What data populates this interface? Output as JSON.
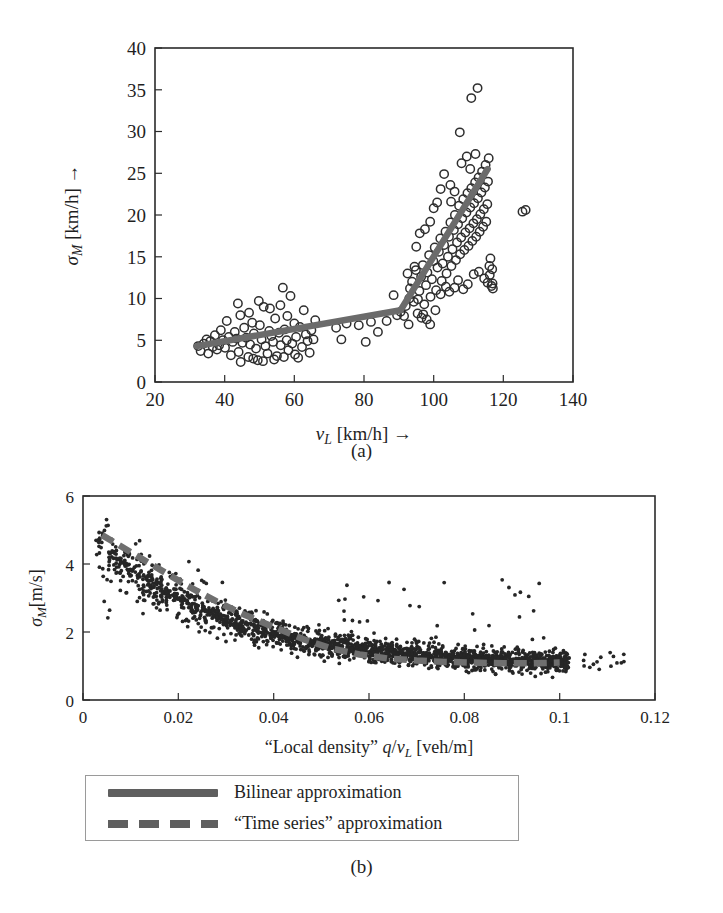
{
  "figure": {
    "panel_a_caption": "(a)",
    "panel_b_caption": "(b)"
  },
  "legend": {
    "position": "below-panel-b",
    "items": [
      {
        "label": "Bilinear approximation",
        "style": "solid",
        "color": "#5f5f5f"
      },
      {
        "label": "“Time series” approximation",
        "style": "dashed",
        "color": "#5f5f5f"
      }
    ]
  },
  "chart_data": [
    {
      "type": "scatter",
      "id": "panel-a",
      "title": "",
      "xlabel": "v_L [km/h] →",
      "xlabel_parts": {
        "symbol": "v",
        "subscript": "L",
        "unit": "[km/h]",
        "arrow": "→"
      },
      "ylabel": "σ_M [km/h] →",
      "ylabel_parts": {
        "symbol": "σ",
        "subscript": "M",
        "unit": "[km/h]",
        "arrow": "→"
      },
      "xlim": [
        20,
        140
      ],
      "ylim": [
        0,
        40
      ],
      "xticks": [
        20,
        40,
        60,
        80,
        100,
        120,
        140
      ],
      "xticklabels": [
        "20",
        "40",
        "60",
        "80",
        "100",
        "120",
        "140"
      ],
      "yticks": [
        0,
        5,
        10,
        15,
        20,
        25,
        30,
        35,
        40
      ],
      "yticklabels": [
        "0",
        "5",
        "10",
        "15",
        "20",
        "25",
        "30",
        "35",
        "40"
      ],
      "grid": false,
      "marker": "open-circle",
      "marker_color": "#2e2e2e",
      "series": [
        {
          "name": "Measured data",
          "type": "scatter",
          "points": [
            [
              32.4,
              4.3
            ],
            [
              33.1,
              3.7
            ],
            [
              34.0,
              4.6
            ],
            [
              34.8,
              5.1
            ],
            [
              35.3,
              3.4
            ],
            [
              35.9,
              4.9
            ],
            [
              36.6,
              4.2
            ],
            [
              37.2,
              5.6
            ],
            [
              37.8,
              3.9
            ],
            [
              38.4,
              4.4
            ],
            [
              38.9,
              6.2
            ],
            [
              39.5,
              5.0
            ],
            [
              40.1,
              4.1
            ],
            [
              40.6,
              7.3
            ],
            [
              41.2,
              5.4
            ],
            [
              41.8,
              3.2
            ],
            [
              42.3,
              4.8
            ],
            [
              42.9,
              6.0
            ],
            [
              43.4,
              5.2
            ],
            [
              44.0,
              3.6
            ],
            [
              44.5,
              8.0
            ],
            [
              45.1,
              4.7
            ],
            [
              45.6,
              6.5
            ],
            [
              46.2,
              5.3
            ],
            [
              46.8,
              3.0
            ],
            [
              47.3,
              4.5
            ],
            [
              47.9,
              7.1
            ],
            [
              48.4,
              5.8
            ],
            [
              49.0,
              4.0
            ],
            [
              49.5,
              2.6
            ],
            [
              50.1,
              6.8
            ],
            [
              50.6,
              5.1
            ],
            [
              51.2,
              9.0
            ],
            [
              51.7,
              4.3
            ],
            [
              52.3,
              3.4
            ],
            [
              52.8,
              6.1
            ],
            [
              53.4,
              5.5
            ],
            [
              53.9,
              4.8
            ],
            [
              54.5,
              7.6
            ],
            [
              55.0,
              3.1
            ],
            [
              55.6,
              5.9
            ],
            [
              56.1,
              4.4
            ],
            [
              56.7,
              11.3
            ],
            [
              57.2,
              6.3
            ],
            [
              57.8,
              5.0
            ],
            [
              58.3,
              3.8
            ],
            [
              58.9,
              10.3
            ],
            [
              59.4,
              4.6
            ],
            [
              60.0,
              7.0
            ],
            [
              60.5,
              5.4
            ],
            [
              61.1,
              2.9
            ],
            [
              61.6,
              6.6
            ],
            [
              62.2,
              4.2
            ],
            [
              62.7,
              8.6
            ],
            [
              63.3,
              5.7
            ],
            [
              63.8,
              4.9
            ],
            [
              64.4,
              3.5
            ],
            [
              64.9,
              6.2
            ],
            [
              65.5,
              5.1
            ],
            [
              66.0,
              7.4
            ],
            [
              43.8,
              9.4
            ],
            [
              47.0,
              8.3
            ],
            [
              49.8,
              9.7
            ],
            [
              53.0,
              8.8
            ],
            [
              56.0,
              9.2
            ],
            [
              58.0,
              7.9
            ],
            [
              44.6,
              2.4
            ],
            [
              48.2,
              2.8
            ],
            [
              51.0,
              2.5
            ],
            [
              54.2,
              2.7
            ],
            [
              57.0,
              3.0
            ],
            [
              60.2,
              3.3
            ],
            [
              72.0,
              6.5
            ],
            [
              73.5,
              5.1
            ],
            [
              75.0,
              7.0
            ],
            [
              78.5,
              6.8
            ],
            [
              80.5,
              4.8
            ],
            [
              82.0,
              7.2
            ],
            [
              84.0,
              6.0
            ],
            [
              86.5,
              7.3
            ],
            [
              88.5,
              10.4
            ],
            [
              89.5,
              8.0
            ],
            [
              90.5,
              8.4
            ],
            [
              91.5,
              7.9
            ],
            [
              92.0,
              9.1
            ],
            [
              92.8,
              6.9
            ],
            [
              93.2,
              11.2
            ],
            [
              93.8,
              12.0
            ],
            [
              94.3,
              9.6
            ],
            [
              94.9,
              13.4
            ],
            [
              95.4,
              8.2
            ],
            [
              95.9,
              10.9
            ],
            [
              96.4,
              12.6
            ],
            [
              96.9,
              14.0
            ],
            [
              97.3,
              9.3
            ],
            [
              97.8,
              11.6
            ],
            [
              98.2,
              13.1
            ],
            [
              98.7,
              15.2
            ],
            [
              99.1,
              10.2
            ],
            [
              99.5,
              12.3
            ],
            [
              99.9,
              14.5
            ],
            [
              100.3,
              16.1
            ],
            [
              100.7,
              11.0
            ],
            [
              101.1,
              13.7
            ],
            [
              101.5,
              15.6
            ],
            [
              101.9,
              17.2
            ],
            [
              102.3,
              12.1
            ],
            [
              102.6,
              14.2
            ],
            [
              103.0,
              16.4
            ],
            [
              103.4,
              18.0
            ],
            [
              103.7,
              13.0
            ],
            [
              104.1,
              15.0
            ],
            [
              104.4,
              17.4
            ],
            [
              104.8,
              19.1
            ],
            [
              105.1,
              13.9
            ],
            [
              105.4,
              15.9
            ],
            [
              105.8,
              18.2
            ],
            [
              106.1,
              20.0
            ],
            [
              106.4,
              14.6
            ],
            [
              106.7,
              16.7
            ],
            [
              107.0,
              18.9
            ],
            [
              107.3,
              21.1
            ],
            [
              107.6,
              15.3
            ],
            [
              107.9,
              17.3
            ],
            [
              108.2,
              19.6
            ],
            [
              108.5,
              21.9
            ],
            [
              108.8,
              15.8
            ],
            [
              109.1,
              17.9
            ],
            [
              109.4,
              20.3
            ],
            [
              109.7,
              22.6
            ],
            [
              110.0,
              16.3
            ],
            [
              110.3,
              18.4
            ],
            [
              110.5,
              20.9
            ],
            [
              110.8,
              23.2
            ],
            [
              111.1,
              16.9
            ],
            [
              111.4,
              19.0
            ],
            [
              111.6,
              21.4
            ],
            [
              111.9,
              23.9
            ],
            [
              112.2,
              17.4
            ],
            [
              112.4,
              19.5
            ],
            [
              112.7,
              22.0
            ],
            [
              112.9,
              24.5
            ],
            [
              113.2,
              18.0
            ],
            [
              113.4,
              20.1
            ],
            [
              113.7,
              22.7
            ],
            [
              113.9,
              25.2
            ],
            [
              114.2,
              18.6
            ],
            [
              114.4,
              20.7
            ],
            [
              114.7,
              23.3
            ],
            [
              114.9,
              26.0
            ],
            [
              115.1,
              19.2
            ],
            [
              115.4,
              21.3
            ],
            [
              115.6,
              24.0
            ],
            [
              115.8,
              26.8
            ],
            [
              116.1,
              12.8
            ],
            [
              116.3,
              14.8
            ],
            [
              116.6,
              11.5
            ],
            [
              116.8,
              13.5
            ],
            [
              117.0,
              11.2
            ],
            [
              103.0,
              24.9
            ],
            [
              104.8,
              23.6
            ],
            [
              106.0,
              22.8
            ],
            [
              108.0,
              26.2
            ],
            [
              109.5,
              27.0
            ],
            [
              110.5,
              25.5
            ],
            [
              112.0,
              27.3
            ],
            [
              96.0,
              17.8
            ],
            [
              97.5,
              18.3
            ],
            [
              99.0,
              19.2
            ],
            [
              94.5,
              13.8
            ],
            [
              95.0,
              16.2
            ],
            [
              100.0,
              20.8
            ],
            [
              101.0,
              21.5
            ],
            [
              102.0,
              23.1
            ],
            [
              105.0,
              21.6
            ],
            [
              113.0,
              13.2
            ],
            [
              114.5,
              12.4
            ],
            [
              115.5,
              11.9
            ],
            [
              116.0,
              13.9
            ],
            [
              116.9,
              11.8
            ],
            [
              97.0,
              8.1
            ],
            [
              98.0,
              7.5
            ],
            [
              99.0,
              6.9
            ],
            [
              96.5,
              7.7
            ],
            [
              95.5,
              9.9
            ],
            [
              100.5,
              8.6
            ],
            [
              107.5,
              29.9
            ],
            [
              110.8,
              34.0
            ],
            [
              112.6,
              35.2
            ],
            [
              125.5,
              20.4
            ],
            [
              126.4,
              20.6
            ],
            [
              107.0,
              12.2
            ],
            [
              108.5,
              11.1
            ],
            [
              109.8,
              11.7
            ],
            [
              111.5,
              12.9
            ],
            [
              92.5,
              13.0
            ],
            [
              93.0,
              10.0
            ],
            [
              102.0,
              10.5
            ],
            [
              103.5,
              11.4
            ],
            [
              104.5,
              10.8
            ],
            [
              106.0,
              11.3
            ]
          ]
        },
        {
          "name": "Bilinear approximation",
          "type": "line",
          "style": "solid",
          "color": "#6b6b6b",
          "points": [
            [
              32.0,
              4.3
            ],
            [
              90.5,
              8.6
            ],
            [
              115.5,
              25.5
            ]
          ]
        }
      ]
    },
    {
      "type": "scatter",
      "id": "panel-b",
      "title": "",
      "xlabel": "“Local density” q/v_L [veh/m]",
      "xlabel_parts": {
        "quoted": "“Local density”",
        "symbol": "q/v",
        "subscript": "L",
        "unit": "[veh/m]"
      },
      "ylabel": "σ_M[m/s]",
      "ylabel_parts": {
        "symbol": "σ",
        "subscript": "M",
        "unit": "[m/s]"
      },
      "xlim": [
        0,
        0.12
      ],
      "ylim": [
        0,
        6
      ],
      "xticks": [
        0,
        0.02,
        0.04,
        0.06,
        0.08,
        0.1,
        0.12
      ],
      "xticklabels": [
        "0",
        "0.02",
        "0.04",
        "0.06",
        "0.08",
        "0.1",
        "0.12"
      ],
      "yticks": [
        0,
        2,
        4,
        6
      ],
      "yticklabels": [
        "0",
        "2",
        "4",
        "6"
      ],
      "grid": false,
      "marker": "filled-dot",
      "marker_color": "#262626",
      "series": [
        {
          "name": "Measured data",
          "type": "scatter",
          "note": "dense decreasing cloud from ~(0.003,5.4) down to ~(0.1,1.0) with sparse outliers above the trend between 0.055 and 0.095"
        },
        {
          "name": "“Time series” approximation",
          "type": "line",
          "style": "dashed",
          "color": "#6f6f6f",
          "points": [
            [
              0.004,
              4.85
            ],
            [
              0.01,
              4.35
            ],
            [
              0.016,
              3.85
            ],
            [
              0.022,
              3.35
            ],
            [
              0.028,
              2.9
            ],
            [
              0.034,
              2.5
            ],
            [
              0.04,
              2.15
            ],
            [
              0.046,
              1.8
            ],
            [
              0.052,
              1.52
            ],
            [
              0.058,
              1.34
            ],
            [
              0.064,
              1.22
            ],
            [
              0.07,
              1.16
            ],
            [
              0.076,
              1.12
            ],
            [
              0.082,
              1.1
            ],
            [
              0.088,
              1.08
            ],
            [
              0.094,
              1.08
            ],
            [
              0.1,
              1.1
            ]
          ]
        }
      ]
    }
  ]
}
